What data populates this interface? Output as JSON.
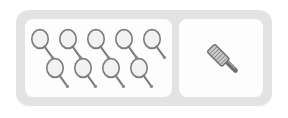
{
  "widget": {
    "name": "item-tray",
    "frame_color": "#e3e3e3",
    "panel_color": "#fdfdfd",
    "background_color": "#ffffff"
  },
  "panels": [
    {
      "id": "items-panel",
      "name": "inventory-items-panel",
      "icon_name": "tennis-racket-icon",
      "icon_color": "#7c7c7c",
      "icon_fill": "#f0f0f0",
      "count": 9,
      "rows": [
        {
          "name": "racket-row-top",
          "count": 5
        },
        {
          "name": "racket-row-bottom",
          "count": 4
        }
      ]
    },
    {
      "id": "tool-panel",
      "name": "selected-tool-panel",
      "icon_name": "brush-icon",
      "icon_color": "#6e6e6e",
      "icon_fill": "#c9c9c9",
      "count": 1
    }
  ]
}
